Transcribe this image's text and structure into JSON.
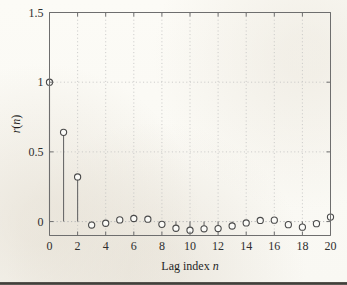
{
  "chart_data": {
    "type": "bar",
    "style": "stem",
    "title": "",
    "xlabel": "Lag index n",
    "ylabel": "r(n)",
    "xlim": [
      0,
      20
    ],
    "ylim": [
      -0.1,
      1.5
    ],
    "xticks": [
      0,
      2,
      4,
      6,
      8,
      10,
      12,
      14,
      16,
      18,
      20
    ],
    "xticklabels": [
      "0",
      "2",
      "4",
      "6",
      "8",
      "10",
      "12",
      "14",
      "16",
      "18",
      "20"
    ],
    "yticks": [
      0,
      0.5,
      1,
      1.5
    ],
    "yticklabels": [
      "0",
      "0.5",
      "1",
      "1.5"
    ],
    "grid": true,
    "legend": null,
    "categories": [
      0,
      1,
      2,
      3,
      4,
      5,
      6,
      7,
      8,
      9,
      10,
      11,
      12,
      13,
      14,
      15,
      16,
      17,
      18,
      19,
      20
    ],
    "values": [
      1.0,
      0.64,
      0.32,
      -0.025,
      -0.012,
      0.012,
      0.022,
      0.017,
      -0.02,
      -0.048,
      -0.062,
      -0.052,
      -0.05,
      -0.032,
      -0.01,
      0.008,
      0.01,
      -0.022,
      -0.04,
      -0.015,
      0.032
    ],
    "series": [
      {
        "name": "r(n)",
        "values": [
          1.0,
          0.64,
          0.32,
          -0.025,
          -0.012,
          0.012,
          0.022,
          0.017,
          -0.02,
          -0.048,
          -0.062,
          -0.052,
          -0.05,
          -0.032,
          -0.01,
          0.008,
          0.01,
          -0.022,
          -0.04,
          -0.015,
          0.032
        ]
      }
    ],
    "marker": "circle-open",
    "colors": {
      "line": "#6b6b6b",
      "marker_edge": "#4a4a4a",
      "marker_face": "#fbfbf8",
      "grid": "#bdbdbd",
      "axis": "#6e6e6e",
      "background": "#fcfcfa"
    }
  },
  "axes": {
    "xlabel_prefix": "Lag index ",
    "xlabel_italic": "n",
    "ylabel_prefix": "r",
    "ylabel_paren_open": "(",
    "ylabel_italic": "n",
    "ylabel_paren_close": ")"
  }
}
